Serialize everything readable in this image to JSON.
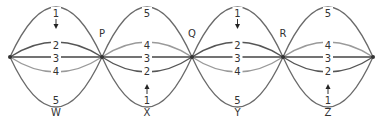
{
  "diagram": {
    "nodes": [
      {
        "id": "n0",
        "label": "",
        "x": 10,
        "y": 57
      },
      {
        "id": "P",
        "label": "P",
        "x": 102,
        "y": 57
      },
      {
        "id": "Q",
        "label": "Q",
        "x": 192,
        "y": 57
      },
      {
        "id": "R",
        "label": "R",
        "x": 283,
        "y": 57
      },
      {
        "id": "n4",
        "label": "",
        "x": 373,
        "y": 57
      }
    ],
    "segments": [
      {
        "label": "W",
        "arrow": "down",
        "arcs": [
          {
            "num": "1",
            "label_y": 13
          },
          {
            "num": "2",
            "label_y": 45
          },
          {
            "num": "3",
            "label_y": 58
          },
          {
            "num": "4",
            "label_y": 71
          },
          {
            "num": "5",
            "label_y": 100
          }
        ]
      },
      {
        "label": "X",
        "arrow": "up",
        "arcs": [
          {
            "num": "5",
            "label_y": 13
          },
          {
            "num": "4",
            "label_y": 45
          },
          {
            "num": "3",
            "label_y": 58
          },
          {
            "num": "2",
            "label_y": 71
          },
          {
            "num": "1",
            "label_y": 100
          }
        ]
      },
      {
        "label": "Y",
        "arrow": "down",
        "arcs": [
          {
            "num": "1",
            "label_y": 13
          },
          {
            "num": "2",
            "label_y": 45
          },
          {
            "num": "3",
            "label_y": 58
          },
          {
            "num": "4",
            "label_y": 71
          },
          {
            "num": "5",
            "label_y": 100
          }
        ]
      },
      {
        "label": "Z",
        "arrow": "up",
        "arcs": [
          {
            "num": "5",
            "label_y": 13
          },
          {
            "num": "4",
            "label_y": 45
          },
          {
            "num": "3",
            "label_y": 58
          },
          {
            "num": "2",
            "label_y": 71
          },
          {
            "num": "1",
            "label_y": 100
          }
        ]
      }
    ],
    "colors": {
      "outer_arc": "#6a6a6a",
      "arc_2": "#555555",
      "arc_4": "#9a9a9a",
      "center_line": "#444444",
      "text": "#333333"
    }
  }
}
